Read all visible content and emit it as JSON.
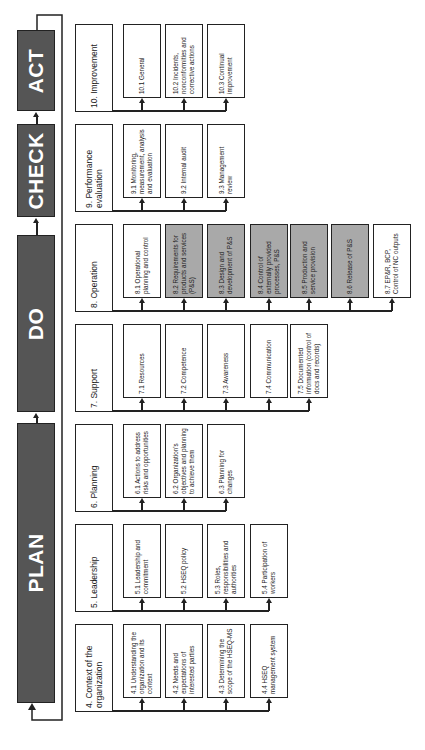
{
  "phases": [
    {
      "label": "ACT",
      "top": 30,
      "height": 81
    },
    {
      "label": "CHECK",
      "top": 124,
      "height": 93
    },
    {
      "label": "DO",
      "top": 235,
      "height": 177
    },
    {
      "label": "PLAN",
      "top": 423,
      "height": 280
    }
  ],
  "rows": [
    {
      "title": "10. Improvement",
      "top": 24,
      "items": [
        {
          "label": "10.1 General",
          "gray": false
        },
        {
          "label": "10.2 Incidents, nonconformities and corrective actions",
          "gray": false
        },
        {
          "label": "10.3 Continual improvement",
          "gray": false
        }
      ]
    },
    {
      "title": "9. Performance evaluation",
      "top": 124,
      "items": [
        {
          "label": "9.1 Monitoring, measurement, analysis and evaluation",
          "gray": false
        },
        {
          "label": "9.2 Internal audit",
          "gray": false
        },
        {
          "label": "9.3 Management review",
          "gray": false
        }
      ]
    },
    {
      "title": "8. Operation",
      "top": 224,
      "items": [
        {
          "label": "8.1 Operational planning and control",
          "gray": false
        },
        {
          "label": "8.2 Requirements for products and services (P&S)",
          "gray": true
        },
        {
          "label": "8.3 Design and development of P&S",
          "gray": true
        },
        {
          "label": "8.4 Control of externally provided processes, P&S",
          "gray": true
        },
        {
          "label": "8.5 Production and service provision",
          "gray": true
        },
        {
          "label": "8.6 Release of P&S",
          "gray": true
        },
        {
          "label": "8.7 EP&R, BCP, Control of NC outputs",
          "gray": false
        }
      ]
    },
    {
      "title": "7. Support",
      "top": 324,
      "items": [
        {
          "label": "7.1 Resources",
          "gray": false
        },
        {
          "label": "7.2 Competence",
          "gray": false
        },
        {
          "label": "7.3 Awareness",
          "gray": false
        },
        {
          "label": "7.4 Communication",
          "gray": false
        },
        {
          "label": "7.5 Documented information (control of docs and records)",
          "gray": false
        }
      ]
    },
    {
      "title": "6. Planning",
      "top": 424,
      "items": [
        {
          "label": "6.1 Actions to address risks and opportunities",
          "gray": false
        },
        {
          "label": "6.2 Organization's objectives and planning to achieve them",
          "gray": false
        },
        {
          "label": "6.3 Planning for changes",
          "gray": false
        }
      ]
    },
    {
      "title": "5. Leadership",
      "top": 524,
      "items": [
        {
          "label": "5.1 Leadership and commitment",
          "gray": false
        },
        {
          "label": "5.2 HSEQ policy",
          "gray": false
        },
        {
          "label": "5.3 Roles, responsibilities and authorities",
          "gray": false
        },
        {
          "label": "5.4 Participation of workers",
          "gray": false
        }
      ]
    },
    {
      "title": "4. Context of the organization",
      "top": 624,
      "items": [
        {
          "label": "4.1 Understanding the organization and its context",
          "gray": false
        },
        {
          "label": "4.2 Needs and expectations of interested parties",
          "gray": false
        },
        {
          "label": "4.3 Determining the scope of the HSEQ-MS",
          "gray": false
        },
        {
          "label": "4.4 HSEQ management system",
          "gray": false
        }
      ]
    }
  ],
  "colors": {
    "phase_fill": "#555555",
    "highlight_fill": "#a9a9a9",
    "line": "#222222"
  }
}
